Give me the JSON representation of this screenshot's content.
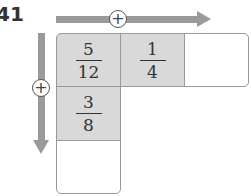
{
  "problem_number": "41",
  "operator_symbol": "+",
  "colors": {
    "shaded": "#d9d9d9",
    "arrow": "#9a9a9a"
  },
  "cells": [
    {
      "num": "5",
      "den": "12"
    },
    {
      "num": "1",
      "den": "4"
    },
    {
      "num": "",
      "den": ""
    },
    {
      "num": "3",
      "den": "8"
    },
    {
      "num": "",
      "den": ""
    }
  ]
}
